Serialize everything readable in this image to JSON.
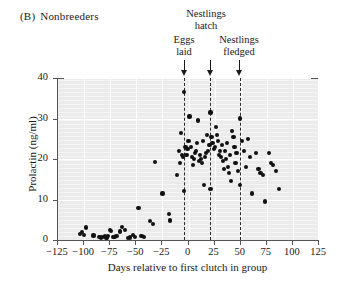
{
  "panel": {
    "tag": "(B)",
    "title": "Nonbreeders"
  },
  "annotations": [
    {
      "name": "eggs-laid",
      "lines": [
        "Eggs",
        "laid"
      ],
      "x": -3
    },
    {
      "name": "nestlings-hatch",
      "lines": [
        "Nestlings",
        "hatch"
      ],
      "x": 22
    },
    {
      "name": "nestlings-fledged",
      "lines": [
        "Nestlings",
        "fledged"
      ],
      "x": 50
    }
  ],
  "chart_data": {
    "type": "scatter",
    "title": "Nonbreeders",
    "xlabel": "Days relative to first clutch in group",
    "ylabel": "Prolactin (ng/ml)",
    "xlim": [
      -125,
      125
    ],
    "ylim": [
      0,
      40
    ],
    "xticks": [
      -125,
      -100,
      -75,
      -50,
      -25,
      0,
      25,
      50,
      75,
      100,
      125
    ],
    "xticklabels": [
      "−125",
      "−100",
      "−75",
      "−50",
      "−25",
      "0",
      "25",
      "50",
      "75",
      "100",
      "125"
    ],
    "yticks": [
      0,
      10,
      20,
      30,
      40
    ],
    "yticklabels": [
      "0",
      "10",
      "20",
      "30",
      "40"
    ],
    "grid": true,
    "grid_color": "#ffffff",
    "plot_background": "#ebebeb",
    "marker_color": "#111111",
    "legend": "none",
    "vlines": [
      {
        "label": "Eggs laid",
        "x": -3
      },
      {
        "label": "Nestlings hatch",
        "x": 22
      },
      {
        "label": "Nestlings fledged",
        "x": 50
      }
    ],
    "points": [
      [
        -103,
        1.4
      ],
      [
        -101,
        2.0
      ],
      [
        -99,
        1.3
      ],
      [
        -97,
        3.1
      ],
      [
        -90,
        1.1
      ],
      [
        -85,
        0.7
      ],
      [
        -83,
        0.6
      ],
      [
        -81,
        0.8
      ],
      [
        -79,
        1.0
      ],
      [
        -78,
        0.6
      ],
      [
        -77,
        0.5
      ],
      [
        -76,
        0.9
      ],
      [
        -74,
        2.4
      ],
      [
        -73,
        2.2
      ],
      [
        -71,
        0.8
      ],
      [
        -70,
        0.7
      ],
      [
        -68,
        1.0
      ],
      [
        -65,
        2.1
      ],
      [
        -63,
        3.2
      ],
      [
        -60,
        2.5
      ],
      [
        -57,
        0.5
      ],
      [
        -55,
        0.6
      ],
      [
        -52,
        1.2
      ],
      [
        -50,
        0.8
      ],
      [
        -47,
        8.0
      ],
      [
        -44,
        1.0
      ],
      [
        -42,
        0.8
      ],
      [
        -36,
        4.6
      ],
      [
        -33,
        3.9
      ],
      [
        -31,
        19.2
      ],
      [
        -24,
        11.5
      ],
      [
        -18,
        6.5
      ],
      [
        -17,
        4.8
      ],
      [
        -10,
        16.0
      ],
      [
        -8,
        22.0
      ],
      [
        -7,
        19.0
      ],
      [
        -6,
        26.5
      ],
      [
        -5,
        21.0
      ],
      [
        -4,
        20.5
      ],
      [
        -3,
        36.5
      ],
      [
        -3,
        12.0
      ],
      [
        -2,
        23.0
      ],
      [
        -1,
        21.0
      ],
      [
        0,
        22.5
      ],
      [
        1,
        24.5
      ],
      [
        2,
        30.5
      ],
      [
        3,
        23.0
      ],
      [
        4,
        20.5
      ],
      [
        5,
        18.5
      ],
      [
        6,
        20.0
      ],
      [
        7,
        21.5
      ],
      [
        8,
        22.0
      ],
      [
        9,
        24.0
      ],
      [
        10,
        29.5
      ],
      [
        11,
        19.5
      ],
      [
        12,
        21.0
      ],
      [
        13,
        20.0
      ],
      [
        14,
        19.0
      ],
      [
        15,
        24.5
      ],
      [
        16,
        13.5
      ],
      [
        17,
        20.5
      ],
      [
        18,
        21.5
      ],
      [
        19,
        26.0
      ],
      [
        20,
        22.0
      ],
      [
        21,
        23.5
      ],
      [
        22,
        31.5
      ],
      [
        22,
        12.5
      ],
      [
        23,
        25.5
      ],
      [
        24,
        24.0
      ],
      [
        25,
        22.5
      ],
      [
        26,
        23.0
      ],
      [
        27,
        28.0
      ],
      [
        28,
        26.0
      ],
      [
        29,
        24.5
      ],
      [
        30,
        21.0
      ],
      [
        31,
        22.0
      ],
      [
        32,
        20.5
      ],
      [
        33,
        23.5
      ],
      [
        34,
        19.5
      ],
      [
        35,
        17.5
      ],
      [
        36,
        22.0
      ],
      [
        37,
        20.0
      ],
      [
        38,
        24.0
      ],
      [
        39,
        18.0
      ],
      [
        40,
        16.5
      ],
      [
        41,
        21.0
      ],
      [
        42,
        14.5
      ],
      [
        43,
        27.0
      ],
      [
        44,
        25.5
      ],
      [
        45,
        23.0
      ],
      [
        46,
        19.0
      ],
      [
        47,
        21.5
      ],
      [
        48,
        17.0
      ],
      [
        50,
        30.0
      ],
      [
        50,
        13.5
      ],
      [
        52,
        24.5
      ],
      [
        54,
        22.0
      ],
      [
        56,
        18.0
      ],
      [
        58,
        25.0
      ],
      [
        60,
        20.5
      ],
      [
        62,
        11.5
      ],
      [
        66,
        21.5
      ],
      [
        68,
        17.5
      ],
      [
        70,
        16.5
      ],
      [
        72,
        16.0
      ],
      [
        74,
        9.5
      ],
      [
        78,
        21.5
      ],
      [
        80,
        19.0
      ],
      [
        82,
        18.5
      ],
      [
        85,
        17.0
      ],
      [
        88,
        12.5
      ]
    ]
  }
}
